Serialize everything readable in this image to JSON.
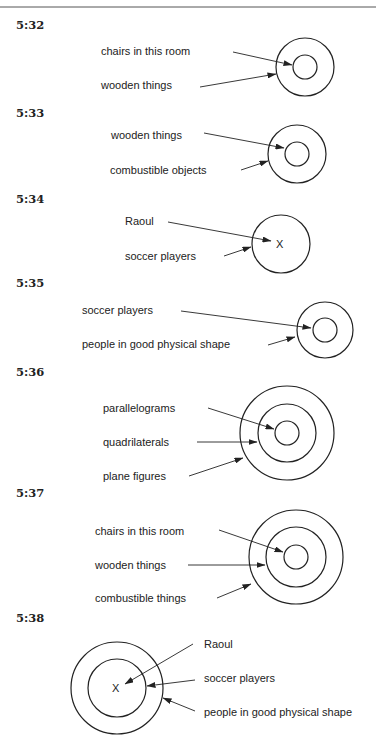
{
  "diagrams": [
    {
      "id": "5:32",
      "heading": "5:32",
      "heading_pos": [
        16,
        29
      ],
      "circles": [
        {
          "cx": 305,
          "cy": 67,
          "r": 29,
          "name": "wooden-things-circle"
        },
        {
          "cx": 305,
          "cy": 67,
          "r": 12,
          "name": "chairs-in-this-room-circle"
        }
      ],
      "labels": [
        {
          "text": "chairs in this room",
          "x": 101,
          "y": 55
        },
        {
          "text": "wooden things",
          "x": 101,
          "y": 89
        }
      ],
      "arrows": [
        {
          "x1": 233,
          "y1": 52,
          "x2": 292,
          "y2": 65
        },
        {
          "x1": 200,
          "y1": 87,
          "x2": 276,
          "y2": 74
        }
      ]
    },
    {
      "id": "5:33",
      "heading": "5:33",
      "heading_pos": [
        16,
        117
      ],
      "circles": [
        {
          "cx": 297,
          "cy": 154,
          "r": 29,
          "name": "combustible-objects-circle"
        },
        {
          "cx": 297,
          "cy": 154,
          "r": 12,
          "name": "wooden-things-circle"
        }
      ],
      "labels": [
        {
          "text": "wooden things",
          "x": 111,
          "y": 139
        },
        {
          "text": "combustible objects",
          "x": 110,
          "y": 174
        }
      ],
      "arrows": [
        {
          "x1": 204,
          "y1": 133,
          "x2": 284,
          "y2": 148
        },
        {
          "x1": 241,
          "y1": 170,
          "x2": 268,
          "y2": 161
        }
      ]
    },
    {
      "id": "5:34",
      "heading": "5:34",
      "heading_pos": [
        16,
        203
      ],
      "circles": [
        {
          "cx": 281,
          "cy": 244,
          "r": 29,
          "name": "soccer-players-circle"
        }
      ],
      "x_marks": [
        {
          "text": "X",
          "x": 276,
          "y": 248
        }
      ],
      "labels": [
        {
          "text": "Raoul",
          "x": 125,
          "y": 225
        },
        {
          "text": "soccer players",
          "x": 125,
          "y": 260
        }
      ],
      "arrows": [
        {
          "x1": 168,
          "y1": 222,
          "x2": 271,
          "y2": 241
        },
        {
          "x1": 224,
          "y1": 256,
          "x2": 251,
          "y2": 247
        }
      ]
    },
    {
      "id": "5:35",
      "heading": "5:35",
      "heading_pos": [
        16,
        287
      ],
      "circles": [
        {
          "cx": 325,
          "cy": 330,
          "r": 28,
          "name": "people-in-good-physical-shape-circle"
        },
        {
          "cx": 325,
          "cy": 330,
          "r": 12,
          "name": "soccer-players-circle"
        }
      ],
      "labels": [
        {
          "text": "soccer players",
          "x": 82,
          "y": 314
        },
        {
          "text": "people in good physical shape",
          "x": 82,
          "y": 348
        }
      ],
      "arrows": [
        {
          "x1": 181,
          "y1": 311,
          "x2": 311,
          "y2": 328
        },
        {
          "x1": 268,
          "y1": 345,
          "x2": 295,
          "y2": 337
        }
      ]
    },
    {
      "id": "5:36",
      "heading": "5:36",
      "heading_pos": [
        16,
        376
      ],
      "circles": [
        {
          "cx": 287,
          "cy": 433,
          "r": 47,
          "name": "plane-figures-circle"
        },
        {
          "cx": 287,
          "cy": 433,
          "r": 29,
          "name": "quadrilaterals-circle"
        },
        {
          "cx": 287,
          "cy": 433,
          "r": 12,
          "name": "parallelograms-circle"
        }
      ],
      "labels": [
        {
          "text": "parallelograms",
          "x": 103,
          "y": 412
        },
        {
          "text": "quadrilaterals",
          "x": 103,
          "y": 446
        },
        {
          "text": "plane figures",
          "x": 103,
          "y": 480
        }
      ],
      "arrows": [
        {
          "x1": 208,
          "y1": 408,
          "x2": 274,
          "y2": 429
        },
        {
          "x1": 197,
          "y1": 442,
          "x2": 257,
          "y2": 442
        },
        {
          "x1": 189,
          "y1": 476,
          "x2": 243,
          "y2": 458
        }
      ]
    },
    {
      "id": "5:37",
      "heading": "5:37",
      "heading_pos": [
        16,
        497
      ],
      "circles": [
        {
          "cx": 296,
          "cy": 557,
          "r": 47,
          "name": "combustible-things-circle"
        },
        {
          "cx": 296,
          "cy": 557,
          "r": 30,
          "name": "wooden-things-circle"
        },
        {
          "cx": 296,
          "cy": 557,
          "r": 12,
          "name": "chairs-in-this-room-circle"
        }
      ],
      "labels": [
        {
          "text": "chairs in this room",
          "x": 95,
          "y": 535
        },
        {
          "text": "wooden things",
          "x": 95,
          "y": 569
        },
        {
          "text": "combustible things",
          "x": 95,
          "y": 602
        }
      ],
      "arrows": [
        {
          "x1": 219,
          "y1": 530,
          "x2": 283,
          "y2": 552
        },
        {
          "x1": 188,
          "y1": 565,
          "x2": 265,
          "y2": 565
        },
        {
          "x1": 217,
          "y1": 598,
          "x2": 251,
          "y2": 584
        }
      ]
    },
    {
      "id": "5:38",
      "heading": "5:38",
      "heading_pos": [
        16,
        622
      ],
      "circles": [
        {
          "cx": 117,
          "cy": 688,
          "r": 46,
          "name": "people-in-good-physical-shape-circle"
        },
        {
          "cx": 117,
          "cy": 688,
          "r": 29,
          "name": "soccer-players-circle"
        }
      ],
      "x_marks": [
        {
          "text": "X",
          "x": 112,
          "y": 692
        }
      ],
      "labels": [
        {
          "text": "Raoul",
          "x": 204,
          "y": 648
        },
        {
          "text": "soccer players",
          "x": 204,
          "y": 682
        },
        {
          "text": "people in good physical shape",
          "x": 204,
          "y": 716
        }
      ],
      "arrows": [
        {
          "x1": 193,
          "y1": 644,
          "x2": 125,
          "y2": 684
        },
        {
          "x1": 195,
          "y1": 680,
          "x2": 147,
          "y2": 686
        },
        {
          "x1": 195,
          "y1": 711,
          "x2": 163,
          "y2": 698
        }
      ]
    }
  ]
}
